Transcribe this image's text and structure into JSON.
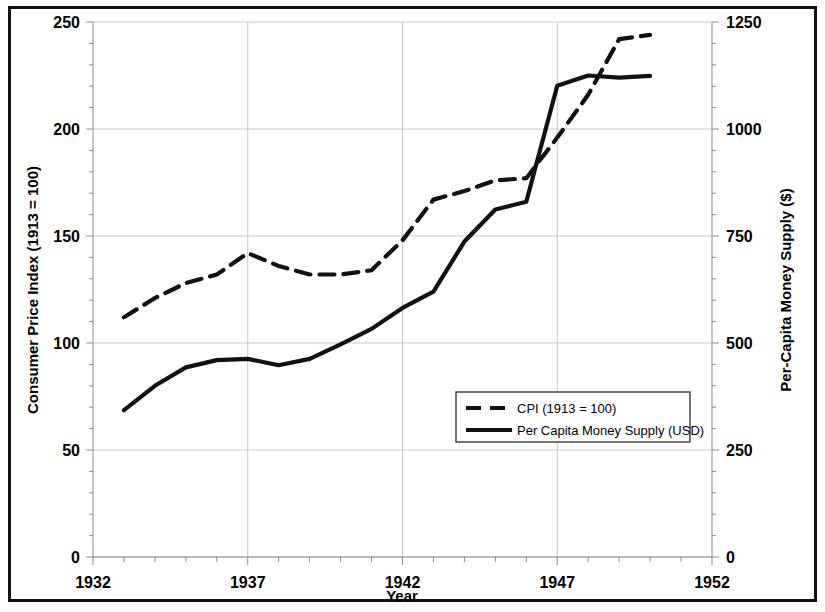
{
  "chart_data": {
    "type": "line",
    "title": "",
    "xlabel": "Year",
    "ylabel": "Consumer Price Index (1913 = 100)",
    "y2label": "Per-Capita Money Supply ($)",
    "xlim": [
      1932,
      1952
    ],
    "ylim": [
      0,
      250
    ],
    "y2lim": [
      0,
      1250
    ],
    "xticks": [
      1932,
      1937,
      1942,
      1947,
      1952
    ],
    "xtick_labels": [
      "1932",
      "1937",
      "1942",
      "1947",
      "1952"
    ],
    "x_minor_tick_step": 1,
    "yticks": [
      0,
      50,
      100,
      150,
      200,
      250
    ],
    "ytick_labels": [
      "0",
      "50",
      "100",
      "150",
      "200",
      "250"
    ],
    "y_minor_tick_step": 10,
    "y2ticks": [
      0,
      250,
      500,
      750,
      1000,
      1250
    ],
    "y2tick_labels": [
      "0",
      "250",
      "500",
      "750",
      "1000",
      "1250"
    ],
    "grid": true,
    "legend_position": "center-right-inside",
    "x": [
      1933,
      1934,
      1935,
      1936,
      1937,
      1938,
      1939,
      1940,
      1941,
      1942,
      1943,
      1944,
      1945,
      1946,
      1947,
      1948,
      1949,
      1950
    ],
    "series": [
      {
        "name": "CPI (1913 = 100)",
        "axis": "left",
        "style": "dashed",
        "color": "#111111",
        "values": [
          112,
          121,
          128,
          132,
          142,
          136,
          132,
          132,
          134,
          148,
          167,
          171,
          176,
          177,
          196,
          216,
          242,
          244
        ]
      },
      {
        "name": "Per Capita Money Supply (USD)",
        "axis": "right",
        "style": "solid",
        "color": "#111111",
        "values": [
          343,
          400,
          443,
          460,
          463,
          448,
          463,
          497,
          533,
          582,
          620,
          737,
          812,
          830,
          1101,
          1125,
          1120,
          1124
        ]
      }
    ],
    "legend": [
      {
        "label": "CPI (1913 = 100)",
        "style": "dashed"
      },
      {
        "label": "Per Capita Money Supply (USD)",
        "style": "solid"
      }
    ]
  }
}
